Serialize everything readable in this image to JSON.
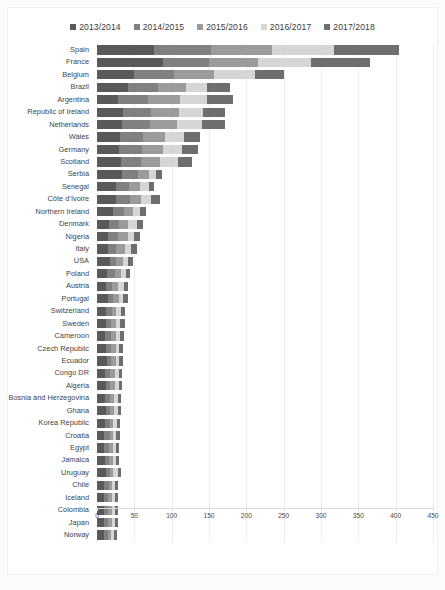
{
  "chart_data": {
    "type": "bar",
    "orientation": "horizontal",
    "stacked": true,
    "title": "",
    "xlabel": "",
    "ylabel": "",
    "xlim": [
      0,
      450
    ],
    "xticks": [
      0,
      50,
      100,
      150,
      200,
      250,
      300,
      350,
      400,
      450
    ],
    "grid": true,
    "legend_position": "top-center",
    "colors": [
      "#595959",
      "#808080",
      "#9b9b9b",
      "#d6d6d6",
      "#6e6e6e"
    ],
    "series": [
      {
        "name": "2013/2014",
        "color": "#595959",
        "values": [
          76,
          88,
          50,
          42,
          28,
          35,
          33,
          31,
          30,
          32,
          34,
          25,
          26,
          22,
          16,
          15,
          15,
          17,
          14,
          12,
          15,
          12,
          12,
          11,
          12,
          13,
          11,
          12,
          11,
          12,
          11,
          10,
          10,
          11,
          12,
          10,
          9,
          10,
          9,
          9
        ],
        "total": 0
      },
      {
        "name": "2014/2015",
        "color": "#808080",
        "values": [
          77,
          62,
          53,
          40,
          40,
          37,
          38,
          30,
          30,
          27,
          21,
          18,
          18,
          14,
          14,
          13,
          11,
          9,
          10,
          8,
          7,
          8,
          7,
          8,
          7,
          6,
          7,
          6,
          7,
          6,
          6,
          7,
          6,
          5,
          5,
          6,
          6,
          5,
          6,
          6
        ],
        "total": 0
      },
      {
        "name": "2015/2016",
        "color": "#9b9b9b",
        "values": [
          81,
          65,
          54,
          37,
          43,
          38,
          36,
          30,
          28,
          25,
          14,
          14,
          15,
          12,
          12,
          13,
          11,
          9,
          8,
          8,
          7,
          6,
          6,
          6,
          6,
          6,
          6,
          6,
          5,
          5,
          5,
          5,
          5,
          5,
          4,
          4,
          5,
          5,
          5,
          4
        ],
        "total": 0
      },
      {
        "name": "2016/2017",
        "color": "#d6d6d6",
        "values": [
          84,
          72,
          55,
          29,
          36,
          32,
          34,
          26,
          26,
          24,
          10,
          12,
          14,
          9,
          11,
          9,
          8,
          7,
          7,
          8,
          6,
          6,
          6,
          6,
          5,
          5,
          5,
          5,
          5,
          5,
          5,
          4,
          5,
          5,
          7,
          4,
          4,
          4,
          4,
          4
        ],
        "total": 0
      },
      {
        "name": "2017/2018",
        "color": "#6e6e6e",
        "values": [
          87,
          78,
          38,
          30,
          35,
          30,
          31,
          21,
          21,
          19,
          8,
          8,
          12,
          9,
          9,
          8,
          8,
          6,
          5,
          6,
          6,
          5,
          6,
          5,
          5,
          5,
          5,
          5,
          4,
          4,
          4,
          5,
          4,
          4,
          4,
          4,
          4,
          4,
          4,
          4
        ],
        "total": 0
      }
    ],
    "categories": [
      "Spain",
      "France",
      "Belgium",
      "Brazil",
      "Argentina",
      "Republic of Ireland",
      "Netherlands",
      "Wales",
      "Germany",
      "Scotland",
      "Serbia",
      "Senegal",
      "Côte d’Ivoire",
      "Northern Ireland",
      "Denmark",
      "Nigeria",
      "Italy",
      "USA",
      "Poland",
      "Austria",
      "Portugal",
      "Switzerland",
      "Sweden",
      "Cameroon",
      "Czech Republic",
      "Ecuador",
      "Congo DR",
      "Algeria",
      "Bosnia and Herzegovina",
      "Ghana",
      "Korea Republic",
      "Croatia",
      "Egypt",
      "Jamaica",
      "Uruguay",
      "Chile",
      "Iceland",
      "Colombia",
      "Japan",
      "Norway"
    ],
    "totals": [
      405,
      365,
      250,
      178,
      182,
      172,
      172,
      138,
      135,
      127,
      87,
      77,
      85,
      66,
      62,
      58,
      53,
      48,
      44,
      42,
      41,
      37,
      37,
      36,
      35,
      35,
      34,
      34,
      32,
      32,
      31,
      31,
      30,
      30,
      32,
      28,
      28,
      28,
      28,
      27
    ]
  },
  "legend": {
    "items": [
      {
        "label": "2013/2014"
      },
      {
        "label": "2014/2015"
      },
      {
        "label": "2015/2016"
      },
      {
        "label": "2016/2017"
      },
      {
        "label": "2017/2018"
      }
    ]
  },
  "axis": {
    "tick_labels": [
      "0",
      "50",
      "100",
      "150",
      "200",
      "250",
      "300",
      "350",
      "400",
      "450"
    ]
  }
}
